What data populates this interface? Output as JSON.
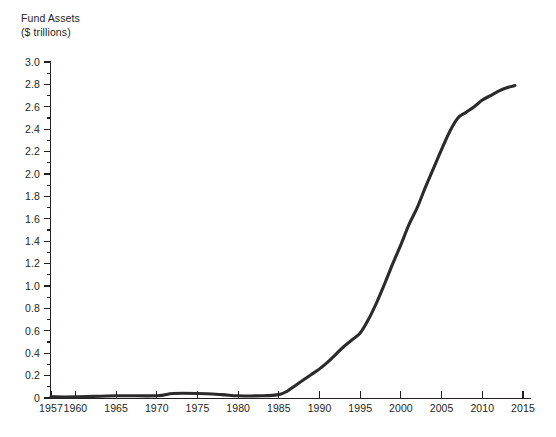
{
  "chart_data": {
    "type": "line",
    "title": "Fund Assets",
    "subtitle": "($ trillions)",
    "xlabel": "",
    "ylabel": "Fund Assets ($ trillions)",
    "xlim": [
      1957,
      2015
    ],
    "ylim": [
      0,
      3.0
    ],
    "grid": false,
    "legend": "none",
    "y_ticks": [
      "0",
      "0.2",
      "0.4",
      "0.6",
      "0.8",
      "1.0",
      "1.2",
      "1.4",
      "1.6",
      "1.8",
      "2.0",
      "2.2",
      "2.4",
      "2.6",
      "2.8",
      "3.0"
    ],
    "y_tick_values": [
      0,
      0.2,
      0.4,
      0.6,
      0.8,
      1.0,
      1.2,
      1.4,
      1.6,
      1.8,
      2.0,
      2.2,
      2.4,
      2.6,
      2.8,
      3.0
    ],
    "y_minor_step": 0.1,
    "x_ticks": [
      "1957",
      "1960",
      "1965",
      "1970",
      "1975",
      "1980",
      "1985",
      "1990",
      "1995",
      "2000",
      "2005",
      "2010",
      "2015"
    ],
    "x_tick_values": [
      1957,
      1960,
      1965,
      1970,
      1975,
      1980,
      1985,
      1990,
      1995,
      2000,
      2005,
      2010,
      2015
    ],
    "series": [
      {
        "name": "Fund Assets",
        "color": "#2b2b2b",
        "x": [
          1957,
          1960,
          1965,
          1970,
          1972,
          1975,
          1978,
          1980,
          1983,
          1985,
          1986,
          1987,
          1988,
          1989,
          1990,
          1991,
          1992,
          1993,
          1994,
          1995,
          1996,
          1997,
          1998,
          1999,
          2000,
          2001,
          2002,
          2003,
          2004,
          2005,
          2006,
          2007,
          2008,
          2009,
          2010,
          2011,
          2012,
          2013,
          2014
        ],
        "y": [
          0.01,
          0.01,
          0.02,
          0.02,
          0.04,
          0.04,
          0.03,
          0.02,
          0.02,
          0.03,
          0.06,
          0.11,
          0.16,
          0.21,
          0.26,
          0.32,
          0.39,
          0.46,
          0.52,
          0.58,
          0.7,
          0.85,
          1.02,
          1.2,
          1.37,
          1.55,
          1.7,
          1.88,
          2.05,
          2.22,
          2.38,
          2.5,
          2.55,
          2.6,
          2.66,
          2.7,
          2.74,
          2.77,
          2.79
        ]
      }
    ]
  },
  "axis": {
    "y_axis_name": "y-axis",
    "x_axis_name": "x-axis"
  }
}
